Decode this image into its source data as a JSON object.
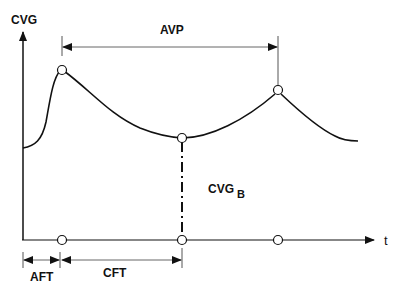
{
  "diagram": {
    "y_axis_label": "CVG",
    "x_axis_label": "t",
    "interval_label_top": "AVP",
    "baseline_label_main": "CVG",
    "baseline_label_subscript": "B",
    "interval_label_1": "AFT",
    "interval_label_2": "CFT",
    "colors": {
      "line": "#111111",
      "thin_line": "#333333",
      "background": "#ffffff"
    },
    "markers": {
      "curve_points": [
        "peak-1",
        "trough",
        "peak-2"
      ],
      "time_points": [
        "t-peak-1",
        "t-trough",
        "t-peak-2"
      ]
    }
  }
}
